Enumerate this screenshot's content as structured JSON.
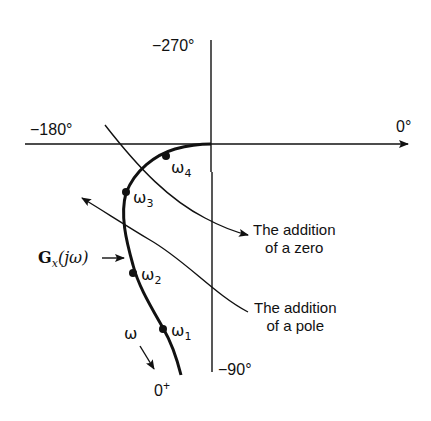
{
  "diagram": {
    "type": "polar-plot",
    "axis_labels": {
      "top": "−270°",
      "left": "−180°",
      "right": "0°",
      "bottom": "−90°"
    },
    "curve_label": {
      "main": "G",
      "subscript": "x",
      "arg": "(jω)"
    },
    "frequency_points": [
      {
        "symbol": "ω",
        "sub": "1"
      },
      {
        "symbol": "ω",
        "sub": "2"
      },
      {
        "symbol": "ω",
        "sub": "3"
      },
      {
        "symbol": "ω",
        "sub": "4"
      }
    ],
    "omega_direction_label": "ω",
    "start_label": {
      "main": "0",
      "sup": "+"
    },
    "annotations": {
      "zero": {
        "line1": "The addition",
        "line2": "of a zero"
      },
      "pole": {
        "line1": "The addition",
        "line2": "of a pole"
      }
    },
    "colors": {
      "line": "#111111",
      "background": "#ffffff"
    }
  }
}
